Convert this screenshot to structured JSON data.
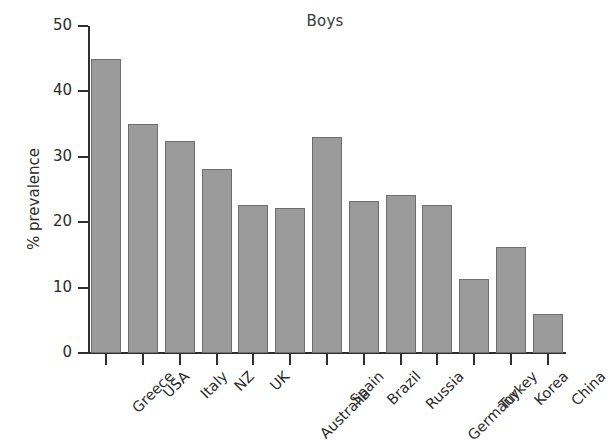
{
  "chart_data": {
    "type": "bar",
    "title": "Boys",
    "xlabel": "",
    "ylabel": "% prevalence",
    "categories": [
      "Greece",
      "USA",
      "Italy",
      "NZ",
      "UK",
      "Australia",
      "Spain",
      "Brazil",
      "Russia",
      "Germany",
      "Turkey",
      "Korea",
      "China"
    ],
    "values": [
      45.0,
      35.0,
      32.4,
      28.1,
      22.7,
      22.1,
      33.0,
      23.2,
      24.2,
      22.6,
      11.3,
      16.2,
      5.9
    ],
    "ylim": [
      0,
      50
    ],
    "yticks": [
      0,
      10,
      20,
      30,
      40,
      50
    ],
    "ytick_labels": [
      "0",
      "10",
      "20",
      "30",
      "40",
      "50"
    ],
    "grid": false,
    "legend": false,
    "bar_color": "#9b9b9b",
    "bar_edge_color": "#6e6e6e",
    "axis_color": "#2f2f2f",
    "staggered_labels": [
      "Australia",
      "Germany"
    ]
  }
}
